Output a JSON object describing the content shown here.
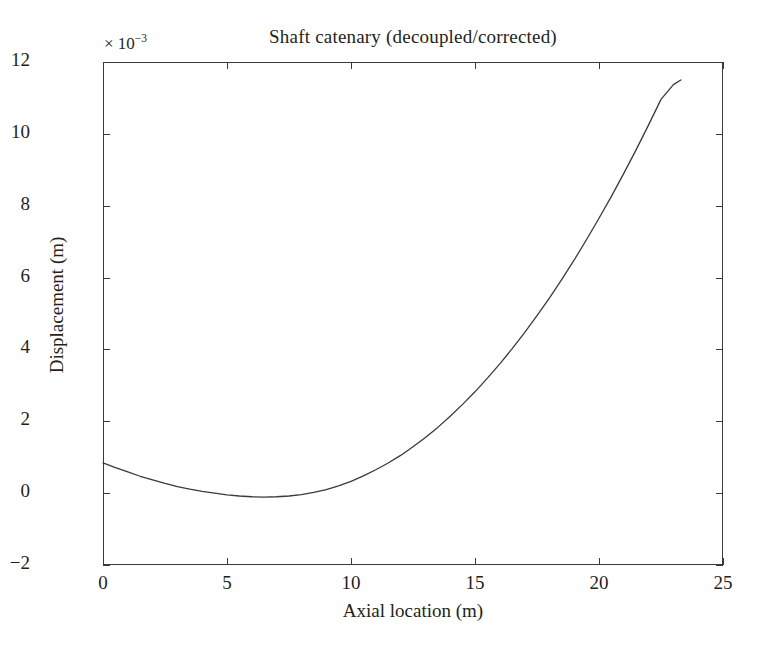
{
  "chart_data": {
    "type": "line",
    "title": "Shaft catenary (decoupled/corrected)",
    "xlabel": "Axial location (m)",
    "ylabel": "Displacement (m)",
    "y_multiplier": "× 10",
    "y_multiplier_exponent": "−3",
    "xlim": [
      0,
      25
    ],
    "ylim": [
      -2,
      12
    ],
    "xticks": [
      "0",
      "5",
      "10",
      "15",
      "20",
      "25"
    ],
    "xtick_values": [
      0,
      5,
      10,
      15,
      20,
      25
    ],
    "yticks": [
      "12",
      "10",
      "8",
      "6",
      "4",
      "2",
      "0",
      "−2"
    ],
    "ytick_values": [
      12,
      10,
      8,
      6,
      4,
      2,
      0,
      -2
    ],
    "grid": false,
    "legend": null,
    "line_color": "#3a3a3a",
    "line_width": 1.3,
    "series": [
      {
        "name": "Shaft catenary",
        "x": [
          0.0,
          0.5,
          1.0,
          1.5,
          2.0,
          2.5,
          3.0,
          3.5,
          4.0,
          4.5,
          5.0,
          5.5,
          6.0,
          6.5,
          7.0,
          7.5,
          8.0,
          8.5,
          9.0,
          9.5,
          10.0,
          10.5,
          11.0,
          11.5,
          12.0,
          12.5,
          13.0,
          13.5,
          14.0,
          14.5,
          15.0,
          15.5,
          16.0,
          16.5,
          17.0,
          17.5,
          18.0,
          18.5,
          19.0,
          19.5,
          20.0,
          20.5,
          21.0,
          21.5,
          22.0,
          22.5,
          23.0,
          23.3
        ],
        "y": [
          0.84,
          0.71,
          0.59,
          0.47,
          0.37,
          0.27,
          0.18,
          0.11,
          0.05,
          0.0,
          -0.05,
          -0.08,
          -0.1,
          -0.11,
          -0.1,
          -0.08,
          -0.04,
          0.02,
          0.1,
          0.2,
          0.33,
          0.48,
          0.65,
          0.84,
          1.05,
          1.29,
          1.55,
          1.83,
          2.14,
          2.47,
          2.82,
          3.2,
          3.6,
          4.02,
          4.47,
          4.94,
          5.43,
          5.95,
          6.49,
          7.06,
          7.65,
          8.26,
          8.9,
          9.56,
          10.25,
          10.96,
          11.37,
          11.5
        ]
      }
    ]
  }
}
